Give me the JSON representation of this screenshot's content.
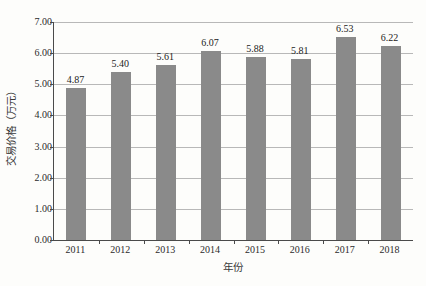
{
  "chart_data": {
    "type": "bar",
    "title": "",
    "subtitle": "",
    "xlabel": "年份",
    "ylabel": "交易价格（万元）",
    "categories": [
      "2011",
      "2012",
      "2013",
      "2014",
      "2015",
      "2016",
      "2017",
      "2018"
    ],
    "values": [
      4.87,
      5.4,
      5.61,
      6.07,
      5.88,
      5.81,
      6.53,
      6.22
    ],
    "value_labels": [
      "4.87",
      "5.40",
      "5.61",
      "6.07",
      "5.88",
      "5.81",
      "6.53",
      "6.22"
    ],
    "ylim": [
      0.0,
      7.0
    ],
    "ytick_values": [
      0.0,
      1.0,
      2.0,
      3.0,
      4.0,
      5.0,
      6.0,
      7.0
    ],
    "ytick_labels": [
      "0.00",
      "1.00",
      "2.00",
      "3.00",
      "4.00",
      "5.00",
      "6.00",
      "7.00"
    ],
    "grid": true,
    "legend": false,
    "legend_position": "none",
    "series": [
      {
        "name": "交易价格",
        "values": [
          4.87,
          5.4,
          5.61,
          6.07,
          5.88,
          5.81,
          6.53,
          6.22
        ],
        "color": "#8a8a8a"
      }
    ],
    "colors": {
      "bar": "#8a8a8a",
      "gridline": "#b8b8b8",
      "axis": "#4a4a4a",
      "text": "#2b2b2b",
      "background": "#fdfdfb"
    }
  }
}
